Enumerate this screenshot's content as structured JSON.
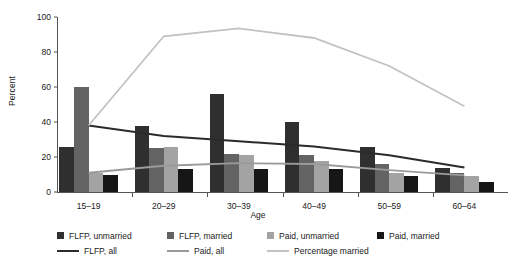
{
  "chart_data": {
    "type": "bar",
    "title": "",
    "xlabel": "Age",
    "ylabel": "Percent",
    "ylim": [
      0,
      100
    ],
    "yticks": [
      0,
      20,
      40,
      60,
      80,
      100
    ],
    "grid": false,
    "legend_position": "bottom",
    "categories": [
      "15–19",
      "20–29",
      "30–39",
      "40–49",
      "50–59",
      "60–64"
    ],
    "series": [
      {
        "name": "FLFP, unmarried",
        "kind": "bar",
        "color": "#2f2f2f",
        "values": [
          26,
          38,
          56,
          40,
          26,
          14
        ]
      },
      {
        "name": "FLFP, married",
        "kind": "bar",
        "color": "#636363",
        "values": [
          60,
          25,
          22,
          21,
          16,
          11
        ]
      },
      {
        "name": "Paid, unmarried",
        "kind": "bar",
        "color": "#a3a3a3",
        "values": [
          11,
          26,
          21,
          18,
          11,
          9
        ]
      },
      {
        "name": "Paid, married",
        "kind": "bar",
        "color": "#161616",
        "values": [
          10,
          13,
          13,
          13,
          9,
          6
        ]
      },
      {
        "name": "FLFP, all",
        "kind": "line",
        "color": "#2b2b2b",
        "values": [
          38,
          32,
          29,
          26,
          21,
          14
        ]
      },
      {
        "name": "Paid, all",
        "kind": "line",
        "color": "#9a9a9a",
        "values": [
          11,
          15,
          16.5,
          16,
          12.5,
          9.5
        ]
      },
      {
        "name": "Percentage married",
        "kind": "line",
        "color": "#c2c2c2",
        "values": [
          38,
          89,
          93.5,
          88,
          72,
          49
        ]
      }
    ]
  },
  "axes": {
    "y_title": "Percent",
    "x_title": "Age",
    "y_tick_labels": [
      "0",
      "20",
      "40",
      "60",
      "80",
      "100"
    ],
    "x_tick_labels": [
      "15–19",
      "20–29",
      "30–39",
      "40–49",
      "50–59",
      "60–64"
    ]
  },
  "legend": {
    "row1": [
      {
        "label": "FLFP, unmarried",
        "marker": "square-swatch",
        "color": "#2f2f2f"
      },
      {
        "label": "FLFP, married",
        "marker": "square-swatch",
        "color": "#636363"
      },
      {
        "label": "Paid, unmarried",
        "marker": "square-swatch",
        "color": "#a3a3a3"
      },
      {
        "label": "Paid, married",
        "marker": "square-swatch",
        "color": "#161616"
      }
    ],
    "row2": [
      {
        "label": "FLFP, all",
        "marker": "line-swatch",
        "color": "#2b2b2b"
      },
      {
        "label": "Paid, all",
        "marker": "line-swatch",
        "color": "#9a9a9a"
      },
      {
        "label": "Percentage married",
        "marker": "line-swatch",
        "color": "#c2c2c2"
      }
    ]
  }
}
